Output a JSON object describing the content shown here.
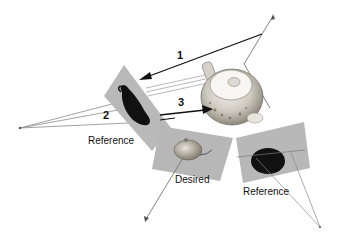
{
  "diagram": {
    "type": "camera-view-diagram",
    "labels": {
      "reference_left": "Reference",
      "desired": "Desired",
      "reference_right": "Reference"
    },
    "arrows": [
      {
        "id": "1",
        "label": "1"
      },
      {
        "id": "2",
        "label": "2"
      },
      {
        "id": "3",
        "label": "3"
      }
    ],
    "colors": {
      "background": "#ffffff",
      "image_plane": "#b8b8b8",
      "silhouette": "#111111",
      "ray": "#777777",
      "arrow": "#111111",
      "teapot_body": "#d8d4cc"
    }
  }
}
